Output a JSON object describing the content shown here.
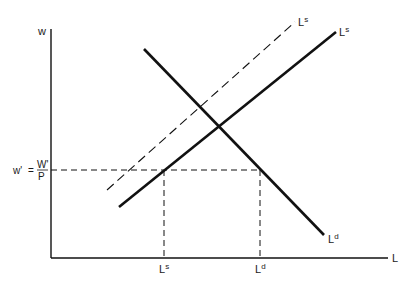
{
  "diagram": {
    "type": "labor-market-supply-demand",
    "axes": {
      "y_label": "w",
      "x_label": "L"
    },
    "curves": {
      "demand": {
        "label": "L",
        "superscript": "d",
        "style": "solid"
      },
      "supply": {
        "label": "L",
        "superscript": "s",
        "style": "solid"
      },
      "supply_shifted": {
        "label": "L",
        "superscript": "s",
        "style": "dashed"
      }
    },
    "wage_level": {
      "lhs": "w'",
      "eq": "=",
      "numerator": "W'",
      "denominator": "P"
    },
    "x_ticks": [
      {
        "label": "L",
        "superscript": "s"
      },
      {
        "label": "L",
        "superscript": "d"
      }
    ]
  },
  "colors": {
    "line": "#111111",
    "background": "#ffffff"
  }
}
